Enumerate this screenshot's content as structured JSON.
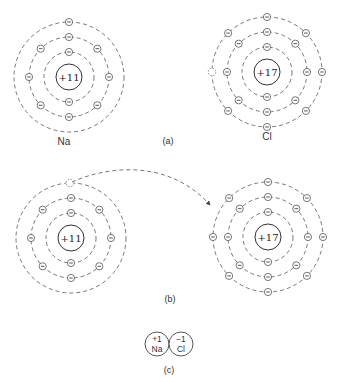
{
  "panels": {
    "a": {
      "caption": "(a)",
      "sodium": {
        "symbol": "Na",
        "nucleus": "+11",
        "shells": [
          2,
          8,
          1
        ]
      },
      "chlorine": {
        "symbol": "Cl",
        "nucleus": "+17",
        "shells": [
          2,
          8,
          7
        ],
        "vacancy": "1 empty slot in outer shell"
      }
    },
    "b": {
      "caption": "(b)",
      "sodium": {
        "nucleus": "+11",
        "shells": [
          2,
          8,
          1
        ],
        "note": "outer electron transferred"
      },
      "chlorine": {
        "nucleus": "+17",
        "shells": [
          2,
          8,
          8
        ]
      },
      "arrow": "electron transfer from Na outer shell to Cl outer shell"
    },
    "c": {
      "caption": "(c)",
      "sodium_ion": {
        "charge": "+1",
        "symbol": "Na"
      },
      "chloride_ion": {
        "charge": "−1",
        "symbol": "Cl"
      }
    }
  }
}
